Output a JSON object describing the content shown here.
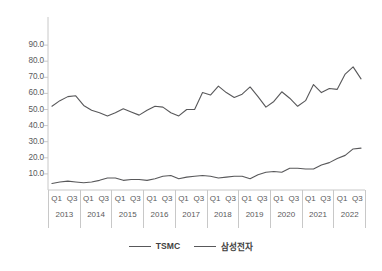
{
  "chart_data": {
    "type": "line",
    "title": "",
    "xlabel": "",
    "ylabel": "",
    "ylim": [
      0,
      95
    ],
    "grid": false,
    "legend_position": "bottom-center",
    "y_ticks": [
      "10.0",
      "20.0",
      "30.0",
      "40.0",
      "50.0",
      "60.0",
      "70.0",
      "80.0",
      "90.0"
    ],
    "y_tick_values": [
      10,
      20,
      30,
      40,
      50,
      60,
      70,
      80,
      90
    ],
    "years": [
      "2013",
      "2014",
      "2015",
      "2016",
      "2017",
      "2018",
      "2019",
      "2020",
      "2021",
      "2022"
    ],
    "quarter_ticks": [
      "Q1",
      "Q3"
    ],
    "x": [
      "2013 Q1",
      "2013 Q2",
      "2013 Q3",
      "2013 Q4",
      "2014 Q1",
      "2014 Q2",
      "2014 Q3",
      "2014 Q4",
      "2015 Q1",
      "2015 Q2",
      "2015 Q3",
      "2015 Q4",
      "2016 Q1",
      "2016 Q2",
      "2016 Q3",
      "2016 Q4",
      "2017 Q1",
      "2017 Q2",
      "2017 Q3",
      "2017 Q4",
      "2018 Q1",
      "2018 Q2",
      "2018 Q3",
      "2018 Q4",
      "2019 Q1",
      "2019 Q2",
      "2019 Q3",
      "2019 Q4",
      "2020 Q1",
      "2020 Q2",
      "2020 Q3",
      "2020 Q4",
      "2021 Q1",
      "2021 Q2",
      "2021 Q3",
      "2021 Q4",
      "2022 Q1",
      "2022 Q2",
      "2022 Q3",
      "2022 Q4"
    ],
    "series": [
      {
        "name": "TSMC",
        "color": "#58585a",
        "values": [
          52.0,
          55.5,
          58.0,
          58.5,
          52.5,
          49.5,
          48.0,
          46.0,
          48.0,
          50.5,
          48.5,
          46.5,
          49.5,
          52.0,
          51.5,
          48.0,
          46.0,
          50.0,
          50.0,
          60.5,
          59.0,
          64.5,
          60.5,
          57.5,
          59.5,
          64.0,
          58.0,
          51.5,
          55.0,
          61.0,
          57.0,
          52.0,
          55.5,
          65.5,
          60.5,
          63.0,
          62.5,
          72.0,
          76.5,
          69.0
        ]
      },
      {
        "name": "삼성전자",
        "color": "#58585a",
        "values": [
          4.0,
          5.0,
          5.5,
          5.0,
          4.5,
          5.0,
          6.0,
          7.5,
          7.5,
          6.0,
          6.5,
          6.5,
          6.0,
          7.0,
          8.5,
          9.0,
          7.0,
          8.0,
          8.5,
          9.0,
          8.5,
          7.5,
          8.0,
          8.5,
          8.5,
          7.0,
          9.5,
          11.0,
          11.5,
          11.0,
          13.5,
          13.5,
          13.0,
          13.0,
          15.5,
          17.0,
          19.5,
          21.5,
          25.5,
          26.0
        ]
      }
    ]
  },
  "legend": {
    "entries": [
      {
        "label": "TSMC"
      },
      {
        "label": "삼성전자"
      }
    ]
  }
}
